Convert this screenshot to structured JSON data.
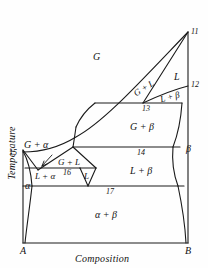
{
  "figure": {
    "type": "phase-diagram",
    "axes": {
      "xlabel": "Composition",
      "ylabel": "Temperature",
      "x_left_endmember": "A",
      "x_right_endmember": "B"
    },
    "phase_regions": [
      {
        "id": "gas",
        "label": "G",
        "x": 97,
        "y": 58
      },
      {
        "id": "gas-plus-liquid-upper",
        "label": "G + L",
        "x": 146,
        "y": 90
      },
      {
        "id": "liquid-upper",
        "label": "L",
        "x": 180,
        "y": 78
      },
      {
        "id": "liquid-plus-beta-upper",
        "label": "L + β",
        "x": 172,
        "y": 100
      },
      {
        "id": "gas-plus-beta",
        "label": "G + β",
        "x": 142,
        "y": 128
      },
      {
        "id": "beta",
        "label": "β",
        "x": 191,
        "y": 150
      },
      {
        "id": "liquid-plus-beta-lower",
        "label": "L + β",
        "x": 142,
        "y": 172
      },
      {
        "id": "gas-plus-alpha",
        "label": "G + α",
        "x": 38,
        "y": 148
      },
      {
        "id": "gas-plus-liquid-lower",
        "label": "G + L",
        "x": 70,
        "y": 166
      },
      {
        "id": "liquid-lower",
        "label": "L",
        "x": 87,
        "y": 178
      },
      {
        "id": "liquid-plus-alpha",
        "label": "L + α",
        "x": 46,
        "y": 178
      },
      {
        "id": "alpha",
        "label": "α",
        "x": 28,
        "y": 188
      },
      {
        "id": "alpha-plus-beta",
        "label": "α + β",
        "x": 106,
        "y": 217
      }
    ],
    "point_labels": [
      {
        "id": "invariant-11",
        "label": "11",
        "x": 197,
        "y": 33
      },
      {
        "id": "invariant-12",
        "label": "12",
        "x": 197,
        "y": 86
      },
      {
        "id": "invariant-13",
        "label": "13",
        "x": 148,
        "y": 111
      },
      {
        "id": "invariant-14",
        "label": "14",
        "x": 141,
        "y": 155
      },
      {
        "id": "invariant-15",
        "label": "15",
        "x": 12,
        "y": 155
      },
      {
        "id": "invariant-16",
        "label": "16",
        "x": 67,
        "y": 174
      },
      {
        "id": "invariant-17",
        "label": "17",
        "x": 110,
        "y": 193
      }
    ],
    "colors": {
      "line": "#1a1a1a",
      "background": "#fefefe",
      "text": "#111111"
    }
  }
}
